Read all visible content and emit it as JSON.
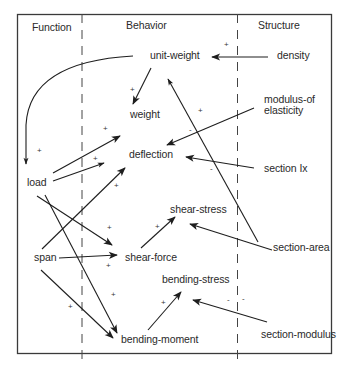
{
  "diagram": {
    "columns": {
      "function": "Function",
      "behavior": "Behavior",
      "structure": "Structure"
    },
    "nodes": {
      "unit_weight": "unit-weight",
      "density": "density",
      "weight": "weight",
      "modulus_line1": "modulus-of",
      "modulus_line2": "elasticity",
      "deflection": "deflection",
      "section_ix": "section Ix",
      "load": "load",
      "shear_stress": "shear-stress",
      "section_area": "section-area",
      "span": "span",
      "shear_force": "shear-force",
      "bending_stress": "bending-stress",
      "section_modulus": "section-modulus",
      "bending_moment": "bending-moment"
    },
    "signs": {
      "density_unit_weight": "+",
      "unit_weight_weight": "+",
      "section_area_unit_weight": "+",
      "modulus_deflection": "-",
      "section_ix_deflection": "-",
      "unit_weight_load": "+",
      "load_weight": "+",
      "load_deflection": "+",
      "span_deflection": "+",
      "load_shear_force": "+",
      "span_shear_force": "+",
      "shear_force_shear_stress": "+",
      "load_bending_moment": "+",
      "span_bending_moment": "+",
      "bending_moment_bending_stress": "+",
      "section_modulus_bending_stress_a": "-",
      "section_modulus_bending_stress_b": "-"
    },
    "edges": [
      {
        "from": "density",
        "to": "unit-weight",
        "sign": "+"
      },
      {
        "from": "unit-weight",
        "to": "weight",
        "sign": "+"
      },
      {
        "from": "unit-weight",
        "to": "load",
        "sign": "+"
      },
      {
        "from": "section-area",
        "to": "unit-weight",
        "sign": "+"
      },
      {
        "from": "modulus-of elasticity",
        "to": "deflection",
        "sign": "-"
      },
      {
        "from": "section Ix",
        "to": "deflection",
        "sign": "-"
      },
      {
        "from": "load",
        "to": "weight",
        "sign": "+"
      },
      {
        "from": "load",
        "to": "deflection",
        "sign": "+"
      },
      {
        "from": "span",
        "to": "deflection",
        "sign": "+"
      },
      {
        "from": "load",
        "to": "shear-force",
        "sign": "+"
      },
      {
        "from": "span",
        "to": "shear-force",
        "sign": "+"
      },
      {
        "from": "shear-force",
        "to": "shear-stress",
        "sign": "+"
      },
      {
        "from": "section-area",
        "to": "shear-stress",
        "sign": "-"
      },
      {
        "from": "load",
        "to": "bending-moment",
        "sign": "+"
      },
      {
        "from": "span",
        "to": "bending-moment",
        "sign": "+"
      },
      {
        "from": "bending-moment",
        "to": "bending-stress",
        "sign": "+"
      },
      {
        "from": "section-modulus",
        "to": "bending-stress",
        "sign": "-"
      }
    ]
  }
}
